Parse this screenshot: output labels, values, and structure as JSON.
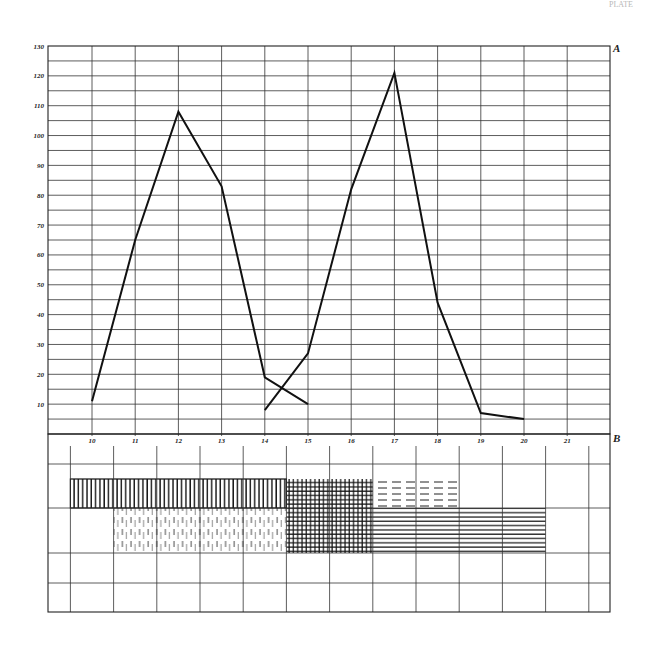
{
  "page_mark": "PLATE",
  "panel_a": {
    "label": "A"
  },
  "panel_b": {
    "label": "B"
  },
  "chart_data": [
    {
      "type": "line",
      "title": "",
      "panel": "A",
      "xlabel": "",
      "ylabel": "",
      "x": [
        10,
        11,
        12,
        13,
        14,
        15,
        16,
        17,
        18,
        19,
        20,
        21
      ],
      "x_tick_labels": [
        "10",
        "11",
        "12",
        "13",
        "14",
        "15",
        "16",
        "17",
        "18",
        "19",
        "20",
        "21"
      ],
      "y_tick_labels": [
        "10",
        "20",
        "30",
        "40",
        "50",
        "60",
        "70",
        "80",
        "90",
        "100",
        "110",
        "120",
        "130"
      ],
      "ylim": [
        0,
        130
      ],
      "grid": true,
      "minor_grid_step": 5,
      "legend": null,
      "series": [
        {
          "name": "curve-1",
          "x": [
            10,
            11,
            12,
            13,
            14,
            15
          ],
          "values": [
            11,
            65,
            108,
            83,
            19,
            10
          ]
        },
        {
          "name": "curve-2",
          "x": [
            14,
            15,
            16,
            17,
            18,
            19,
            20
          ],
          "values": [
            8,
            27,
            82,
            121,
            44,
            7,
            5
          ]
        }
      ]
    },
    {
      "type": "table",
      "panel": "B",
      "title": "",
      "description": "Hatched band diagram aligned under panel A",
      "bands": [
        {
          "name": "vertical-hatch-band",
          "pattern": "vertical",
          "x_from": 9.5,
          "x_to": 14.5,
          "row": 1
        },
        {
          "name": "crosshatch-band",
          "pattern": "crosshatch",
          "x_from": 14.5,
          "x_to": 16.5,
          "row_from": 1,
          "row_to": 2
        },
        {
          "name": "dashed-horizontal-band",
          "pattern": "dashed-horizontal",
          "x_from": 16.5,
          "x_to": 18.5,
          "row": 1
        },
        {
          "name": "broken-vertical-band",
          "pattern": "broken-vertical",
          "x_from": 10.5,
          "x_to": 14.5,
          "row": 2
        },
        {
          "name": "horizontal-hatch-band",
          "pattern": "horizontal",
          "x_from": 16.5,
          "x_to": 20.5,
          "row": 2
        }
      ]
    }
  ]
}
